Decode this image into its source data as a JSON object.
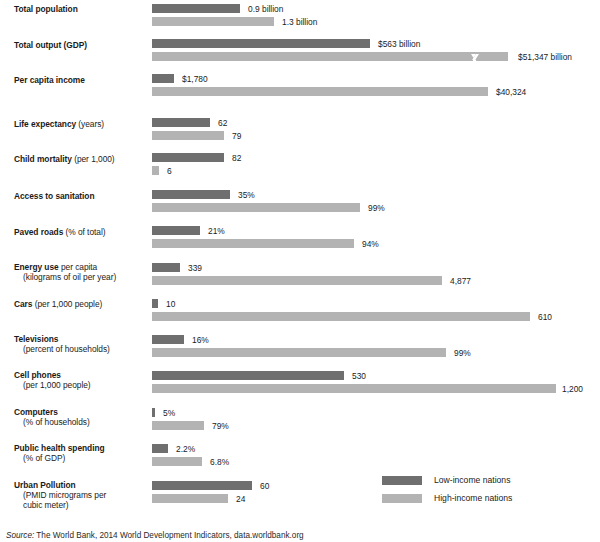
{
  "chart_data": {
    "type": "bar",
    "orientation": "horizontal",
    "title": "",
    "subtitle": "",
    "xlabel": "",
    "ylabel": "",
    "grid": false,
    "legend_position": "bottom-right",
    "note": "Each indicator uses its own independent horizontal scale; bar lengths are not comparable across rows.",
    "series": [
      {
        "name": "Low-income nations",
        "color": "#6f6f6f"
      },
      {
        "name": "High-income nations",
        "color": "#b3b3b3"
      }
    ],
    "categories": [
      "Total population",
      "Total output (GDP)",
      "Per capita income",
      "Life expectancy (years)",
      "Child mortality (per 1,000)",
      "Access to sanitation",
      "Paved roads (% of total)",
      "Energy use per capita (kilograms of oil per year)",
      "Cars (per 1,000 people)",
      "Televisions (percent of households)",
      "Cell phones (per 1,000 people)",
      "Computers (% of households)",
      "Public health spending (% of GDP)",
      "Urban Pollution (PMID micrograms per cubic meter)"
    ],
    "rows": [
      {
        "id": "total-population",
        "top": 4,
        "label_top": 4,
        "label_lines": [
          {
            "bold": "Total population",
            "regular": "",
            "indent": false
          }
        ],
        "low": {
          "value": 0.9,
          "unit": "billion",
          "display": "0.9 billion",
          "width": 88,
          "label_gap": 8
        },
        "high": {
          "value": 1.3,
          "unit": "billion",
          "display": "1.3 billion",
          "width": 122,
          "label_gap": 8
        }
      },
      {
        "id": "total-output-gdp",
        "top": 39,
        "label_top": 40,
        "label_lines": [
          {
            "bold": "Total output (GDP)",
            "regular": "",
            "indent": false
          }
        ],
        "low": {
          "value": 563,
          "unit": "$ billion",
          "display": "$563 billion",
          "width": 218,
          "label_gap": 8
        },
        "high": {
          "value": 51347,
          "unit": "$ billion",
          "display": "$51,347 billion",
          "width": 356,
          "label_gap": 10,
          "break_at": 318
        }
      },
      {
        "id": "per-capita-income",
        "top": 74,
        "label_top": 75,
        "label_lines": [
          {
            "bold": "Per capita income",
            "regular": "",
            "indent": false
          }
        ],
        "low": {
          "value": 1780,
          "unit": "$",
          "display": "$1,780",
          "width": 22,
          "label_gap": 8
        },
        "high": {
          "value": 40324,
          "unit": "$",
          "display": "$40,324",
          "width": 336,
          "label_gap": 8
        }
      },
      {
        "id": "life-expectancy",
        "top": 118,
        "label_top": 119,
        "label_lines": [
          {
            "bold": "Life expectancy",
            "regular": " (years)",
            "indent": false
          }
        ],
        "low": {
          "value": 62,
          "unit": "years",
          "display": "62",
          "width": 58,
          "label_gap": 8
        },
        "high": {
          "value": 79,
          "unit": "years",
          "display": "79",
          "width": 72,
          "label_gap": 8
        }
      },
      {
        "id": "child-mortality",
        "top": 153,
        "label_top": 154,
        "label_lines": [
          {
            "bold": "Child mortality",
            "regular": " (per 1,000)",
            "indent": false
          }
        ],
        "low": {
          "value": 82,
          "unit": "per 1,000",
          "display": "82",
          "width": 72,
          "label_gap": 8
        },
        "high": {
          "value": 6,
          "unit": "per 1,000",
          "display": "6",
          "width": 7,
          "label_gap": 8
        }
      },
      {
        "id": "access-to-sanitation",
        "top": 190,
        "label_top": 191,
        "label_lines": [
          {
            "bold": "Access to sanitation",
            "regular": "",
            "indent": false
          }
        ],
        "low": {
          "value": 35,
          "unit": "%",
          "display": "35%",
          "width": 78,
          "label_gap": 8
        },
        "high": {
          "value": 99,
          "unit": "%",
          "display": "99%",
          "width": 208,
          "label_gap": 8
        }
      },
      {
        "id": "paved-roads",
        "top": 226,
        "label_top": 227,
        "label_lines": [
          {
            "bold": "Paved roads",
            "regular": " (% of total)",
            "indent": false
          }
        ],
        "low": {
          "value": 21,
          "unit": "%",
          "display": "21%",
          "width": 48,
          "label_gap": 8
        },
        "high": {
          "value": 94,
          "unit": "%",
          "display": "94%",
          "width": 202,
          "label_gap": 8
        }
      },
      {
        "id": "energy-use-per-capita",
        "top": 263,
        "label_top": 262,
        "label_lines": [
          {
            "bold": "Energy use",
            "regular": " per capita",
            "indent": false
          },
          {
            "bold": "",
            "regular": "(kilograms of oil per year)",
            "indent": true
          }
        ],
        "low": {
          "value": 339,
          "unit": "kg oil/year",
          "display": "339",
          "width": 28,
          "label_gap": 8
        },
        "high": {
          "value": 4877,
          "unit": "kg oil/year",
          "display": "4,877",
          "width": 290,
          "label_gap": 8
        }
      },
      {
        "id": "cars",
        "top": 299,
        "label_top": 299,
        "label_lines": [
          {
            "bold": "Cars",
            "regular": " (per 1,000 people)",
            "indent": false
          }
        ],
        "low": {
          "value": 10,
          "unit": "per 1,000 people",
          "display": "10",
          "width": 6,
          "label_gap": 8
        },
        "high": {
          "value": 610,
          "unit": "per 1,000 people",
          "display": "610",
          "width": 378,
          "label_gap": 8
        }
      },
      {
        "id": "televisions",
        "top": 335,
        "label_top": 334,
        "label_lines": [
          {
            "bold": "Televisions",
            "regular": "",
            "indent": false
          },
          {
            "bold": "",
            "regular": "(percent of households)",
            "indent": true
          }
        ],
        "low": {
          "value": 16,
          "unit": "%",
          "display": "16%",
          "width": 32,
          "label_gap": 8
        },
        "high": {
          "value": 99,
          "unit": "%",
          "display": "99%",
          "width": 294,
          "label_gap": 8
        }
      },
      {
        "id": "cell-phones",
        "top": 371,
        "label_top": 370,
        "label_lines": [
          {
            "bold": "Cell phones",
            "regular": "",
            "indent": false
          },
          {
            "bold": "",
            "regular": "(per 1,000 people)",
            "indent": true
          }
        ],
        "low": {
          "value": 530,
          "unit": "per 1,000 people",
          "display": "530",
          "width": 192,
          "label_gap": 8
        },
        "high": {
          "value": 1200,
          "unit": "per 1,000 people",
          "display": "1,200",
          "width": 404,
          "label_gap": 6
        }
      },
      {
        "id": "computers",
        "top": 408,
        "label_top": 407,
        "label_lines": [
          {
            "bold": "Computers",
            "regular": "",
            "indent": false
          },
          {
            "bold": "",
            "regular": "(% of households)",
            "indent": true
          }
        ],
        "low": {
          "value": 5,
          "unit": "%",
          "display": "5%",
          "width": 3,
          "label_gap": 8
        },
        "high": {
          "value": 79,
          "unit": "%",
          "display": "79%",
          "width": 52,
          "label_gap": 8
        }
      },
      {
        "id": "public-health-spending",
        "top": 444,
        "label_top": 443,
        "label_lines": [
          {
            "bold": "Public health spending",
            "regular": "",
            "indent": false
          },
          {
            "bold": "",
            "regular": "(% of GDP)",
            "indent": true
          }
        ],
        "low": {
          "value": 2.2,
          "unit": "%",
          "display": "2.2%",
          "width": 16,
          "label_gap": 8
        },
        "high": {
          "value": 6.8,
          "unit": "%",
          "display": "6.8%",
          "width": 50,
          "label_gap": 8
        }
      },
      {
        "id": "urban-pollution",
        "top": 481,
        "label_top": 480,
        "label_lines": [
          {
            "bold": "Urban Pollution",
            "regular": "",
            "indent": false
          },
          {
            "bold": "",
            "regular": "(PMID micrograms per",
            "indent": true
          },
          {
            "bold": "",
            "regular": "cubic meter)",
            "indent": true
          }
        ],
        "low": {
          "value": 60,
          "unit": "micrograms/m3",
          "display": "60",
          "width": 100,
          "label_gap": 8
        },
        "high": {
          "value": 24,
          "unit": "micrograms/m3",
          "display": "24",
          "width": 76,
          "label_gap": 8
        }
      }
    ]
  },
  "legend": {
    "items": [
      {
        "label": "Low-income nations",
        "color": "#6f6f6f",
        "key": "low"
      },
      {
        "label": "High-income nations",
        "color": "#b3b3b3",
        "key": "high"
      }
    ]
  },
  "source": {
    "prefix": "Source:",
    "text": "The World Bank, 2014 World Development Indicators, data.worldbank.org"
  },
  "colors": {
    "low_income": "#6f6f6f",
    "high_income": "#b3b3b3",
    "text": "#1b1b1b",
    "background": "#ffffff"
  }
}
